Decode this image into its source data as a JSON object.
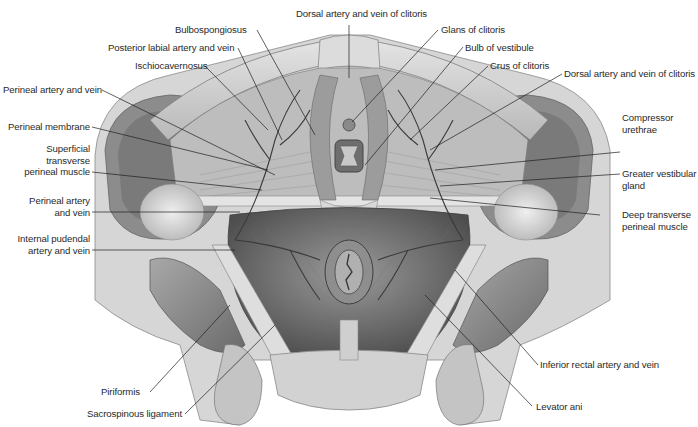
{
  "figure": {
    "type": "anatomical illustration",
    "palette": {
      "background": "#ffffff",
      "bone": "#c9c9c9",
      "bone_light": "#e2e2e2",
      "muscle": "#8a8a8a",
      "muscle_dark": "#5e5e5e",
      "vessel": "#3a3a3a",
      "leader_line": "#1e1e1e",
      "label_text": "#2a2a2a"
    }
  },
  "labels": {
    "dorsal_artery_top": "Dorsal artery and vein of clitoris",
    "bulbospongiosus": "Bulbospongiosus",
    "posterior_labial": "Posterior labial artery and vein",
    "ischiocavernosus": "Ischiocavernosus",
    "perineal_artery_top": "Perineal artery and vein",
    "perineal_membrane": "Perineal membrane",
    "superficial_transverse_1": "Superficial",
    "superficial_transverse_2": "transverse",
    "superficial_transverse_3": "perineal muscle",
    "perineal_artery_mid_1": "Perineal artery",
    "perineal_artery_mid_2": "and vein",
    "internal_pudendal_1": "Internal pudendal",
    "internal_pudendal_2": "artery and vein",
    "piriformis": "Piriformis",
    "sacrospinous": "Sacrospinous ligament",
    "glans": "Glans of clitoris",
    "bulb_vestibule": "Bulb of vestibule",
    "crus": "Crus of clitoris",
    "dorsal_artery_right": "Dorsal artery and vein of clitoris",
    "compressor_1": "Compressor",
    "compressor_2": "urethrae",
    "greater_vestibular_1": "Greater vestibular",
    "greater_vestibular_2": "gland",
    "deep_transverse_1": "Deep transverse",
    "deep_transverse_2": "perineal muscle",
    "inferior_rectal": "Inferior rectal artery and vein",
    "levator_ani": "Levator ani"
  }
}
